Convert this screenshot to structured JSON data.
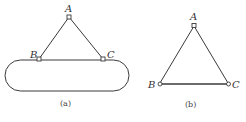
{
  "figures": [
    {
      "id": "a",
      "caption": "(a)",
      "points": {
        "A": "A",
        "B": "B",
        "C": "C"
      },
      "description": "Two-bar truss A-B, A-C attached at B and C to a rounded (stadium-shaped) rigid body"
    },
    {
      "id": "b",
      "caption": "(b)",
      "points": {
        "A": "A",
        "B": "B",
        "C": "C"
      },
      "description": "Triangular truss with pin joints at A, B, C"
    }
  ],
  "colors": {
    "stroke": "#3a3a3a",
    "text": "#333333",
    "background": "#ffffff"
  }
}
